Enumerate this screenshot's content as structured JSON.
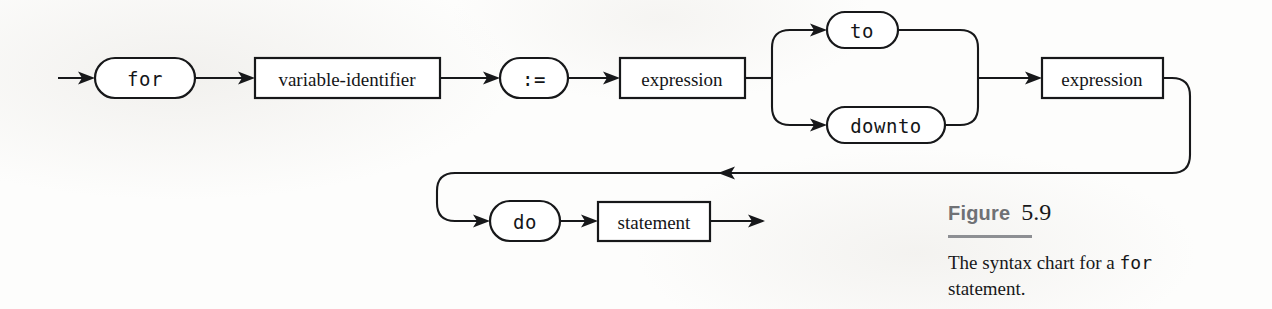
{
  "figure": {
    "label_word": "Figure",
    "number": "5.9",
    "caption_prefix": "The syntax chart for a ",
    "caption_keyword": "for",
    "caption_suffix": " statement."
  },
  "diagram": {
    "kind": "railroad-syntax-chart",
    "nodes": [
      {
        "id": "for",
        "text": "for",
        "shape": "stadium",
        "style": "terminal",
        "row": 1
      },
      {
        "id": "variable-identifier",
        "text": "variable-identifier",
        "shape": "rectangle",
        "style": "nonterminal",
        "row": 1
      },
      {
        "id": "assign",
        "text": ":=",
        "shape": "stadium",
        "style": "terminal",
        "row": 1
      },
      {
        "id": "expression-start",
        "text": "expression",
        "shape": "rectangle",
        "style": "nonterminal",
        "row": 1
      },
      {
        "id": "to",
        "text": "to",
        "shape": "stadium",
        "style": "terminal",
        "row": "branch-upper"
      },
      {
        "id": "downto",
        "text": "downto",
        "shape": "stadium",
        "style": "terminal",
        "row": "branch-lower"
      },
      {
        "id": "expression-limit",
        "text": "expression",
        "shape": "rectangle",
        "style": "nonterminal",
        "row": 1
      },
      {
        "id": "do",
        "text": "do",
        "shape": "stadium",
        "style": "terminal",
        "row": 2
      },
      {
        "id": "statement",
        "text": "statement",
        "shape": "rectangle",
        "style": "nonterminal",
        "row": 2
      }
    ],
    "colors": {
      "ink": "#17181a",
      "paper": "#fdfdfc",
      "caption_word": "#6f7175",
      "caption_rule": "#8d8f93"
    }
  }
}
